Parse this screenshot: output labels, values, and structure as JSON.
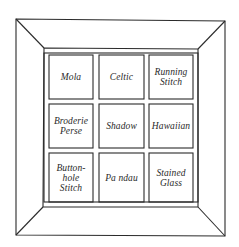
{
  "diagram": {
    "type": "quilt-layout",
    "colors": {
      "line": "#2b2b2b",
      "background": "#ffffff",
      "text": "#2a2a2a"
    },
    "grid": {
      "rows": 3,
      "columns": 3
    },
    "panels": [
      {
        "row": 1,
        "col": 1,
        "label": "Mola"
      },
      {
        "row": 1,
        "col": 2,
        "label": "Celtic"
      },
      {
        "row": 1,
        "col": 3,
        "label": "Running\nStitch"
      },
      {
        "row": 2,
        "col": 1,
        "label": "Broderie\nPerse"
      },
      {
        "row": 2,
        "col": 2,
        "label": "Shadow"
      },
      {
        "row": 2,
        "col": 3,
        "label": "Hawaiian"
      },
      {
        "row": 3,
        "col": 1,
        "label": "Button-\nhole\nStitch"
      },
      {
        "row": 3,
        "col": 2,
        "label": "Pa ndau"
      },
      {
        "row": 3,
        "col": 3,
        "label": "Stained\nGlass"
      }
    ]
  }
}
